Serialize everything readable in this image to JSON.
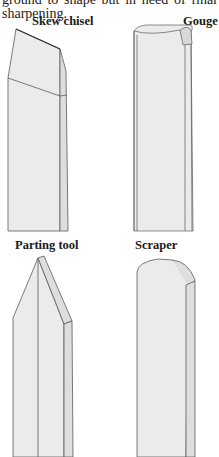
{
  "text": {
    "intro": "ground to shape but in need of final sharpening."
  },
  "figures": [
    {
      "id": "skew-chisel",
      "label": "Skew chisel"
    },
    {
      "id": "gouge",
      "label": "Gouge"
    },
    {
      "id": "parting-tool",
      "label": "Parting tool"
    },
    {
      "id": "scraper",
      "label": "Scraper"
    }
  ],
  "colors": {
    "stroke": "#5a5a5a",
    "fill": "#ebebeb",
    "fill_side": "#dedede",
    "background": "#ffffff"
  }
}
